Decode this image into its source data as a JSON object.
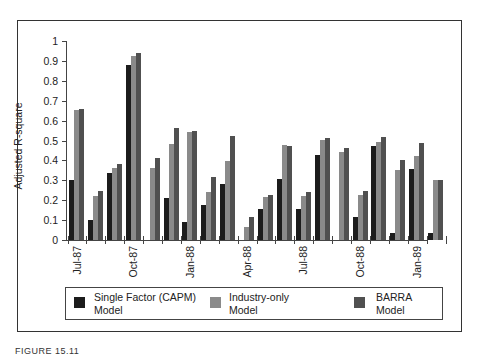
{
  "chart_data": {
    "type": "bar",
    "title": "",
    "xlabel": "",
    "ylabel": "Adjusted R-square",
    "ylim": [
      0,
      1
    ],
    "yticks": [
      "0",
      "0.1",
      "0.2",
      "0.3",
      "0.4",
      "0.5",
      "0.6",
      "0.7",
      "0.8",
      "0.9",
      "1"
    ],
    "grid": false,
    "legend_position": "bottom",
    "categories": [
      "Jul-87",
      "Aug-87",
      "Sep-87",
      "Oct-87",
      "Nov-87",
      "Dec-87",
      "Jan-88",
      "Feb-88",
      "Mar-88",
      "Apr-88",
      "May-88",
      "Jun-88",
      "Jul-88",
      "Aug-88",
      "Sep-88",
      "Oct-88",
      "Nov-88",
      "Dec-88",
      "Jan-89",
      "Feb-89"
    ],
    "xtick_labels": [
      {
        "label": "Jul-87",
        "index": 0
      },
      {
        "label": "Oct-87",
        "index": 3
      },
      {
        "label": "Jan-88",
        "index": 6
      },
      {
        "label": "Apr-88",
        "index": 9
      },
      {
        "label": "Jul-88",
        "index": 12
      },
      {
        "label": "Oct-88",
        "index": 15
      },
      {
        "label": "Jan-89",
        "index": 18
      }
    ],
    "series": [
      {
        "name": "Single Factor (CAPM) Model",
        "color": "#1c1c1c",
        "values": [
          0.3,
          0.1,
          0.335,
          0.88,
          0.0,
          0.21,
          0.09,
          0.175,
          0.28,
          0.0,
          0.155,
          0.305,
          0.155,
          0.425,
          0.0,
          0.115,
          0.47,
          0.035,
          0.355,
          0.035
        ]
      },
      {
        "name": "Industry-only Model",
        "color": "#8a8a8a",
        "values": [
          0.655,
          0.22,
          0.36,
          0.925,
          0.36,
          0.485,
          0.545,
          0.24,
          0.395,
          0.065,
          0.215,
          0.475,
          0.22,
          0.505,
          0.44,
          0.225,
          0.495,
          0.35,
          0.42,
          0.3
        ]
      },
      {
        "name": "BARRA Model",
        "color": "#505050",
        "values": [
          0.66,
          0.245,
          0.38,
          0.94,
          0.41,
          0.565,
          0.55,
          0.315,
          0.525,
          0.115,
          0.225,
          0.47,
          0.24,
          0.515,
          0.46,
          0.245,
          0.52,
          0.4,
          0.49,
          0.3
        ]
      }
    ]
  },
  "legend": {
    "items": [
      {
        "line1": "Single Factor (CAPM)",
        "line2": "Model",
        "color": "#1c1c1c"
      },
      {
        "line1": "Industry-only",
        "line2": "Model",
        "color": "#8a8a8a"
      },
      {
        "line1": "BARRA",
        "line2": "Model",
        "color": "#505050"
      }
    ]
  },
  "caption": "FIGURE 15.11"
}
